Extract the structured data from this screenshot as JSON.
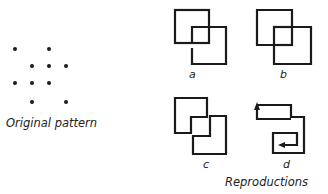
{
  "original": {
    "caption": "Original pattern",
    "dots": [
      {
        "x": 15,
        "y": 49
      },
      {
        "x": 49,
        "y": 49
      },
      {
        "x": 32,
        "y": 66
      },
      {
        "x": 49,
        "y": 66
      },
      {
        "x": 66,
        "y": 66
      },
      {
        "x": 15,
        "y": 83
      },
      {
        "x": 32,
        "y": 83
      },
      {
        "x": 49,
        "y": 83
      },
      {
        "x": 32,
        "y": 102
      },
      {
        "x": 66,
        "y": 102
      }
    ]
  },
  "reproductions": {
    "caption": "Reproductions",
    "figures": [
      {
        "label": "a",
        "description": "two overlapping squares, lower square's left edge interrupted"
      },
      {
        "label": "b",
        "description": "two overlapping squares forming an inner square"
      },
      {
        "label": "c",
        "description": "two interlocking notched shapes"
      },
      {
        "label": "d",
        "description": "spiral path with arrows"
      }
    ]
  },
  "colors": {
    "stroke": "#1a1a1a",
    "background": "#ffffff"
  }
}
